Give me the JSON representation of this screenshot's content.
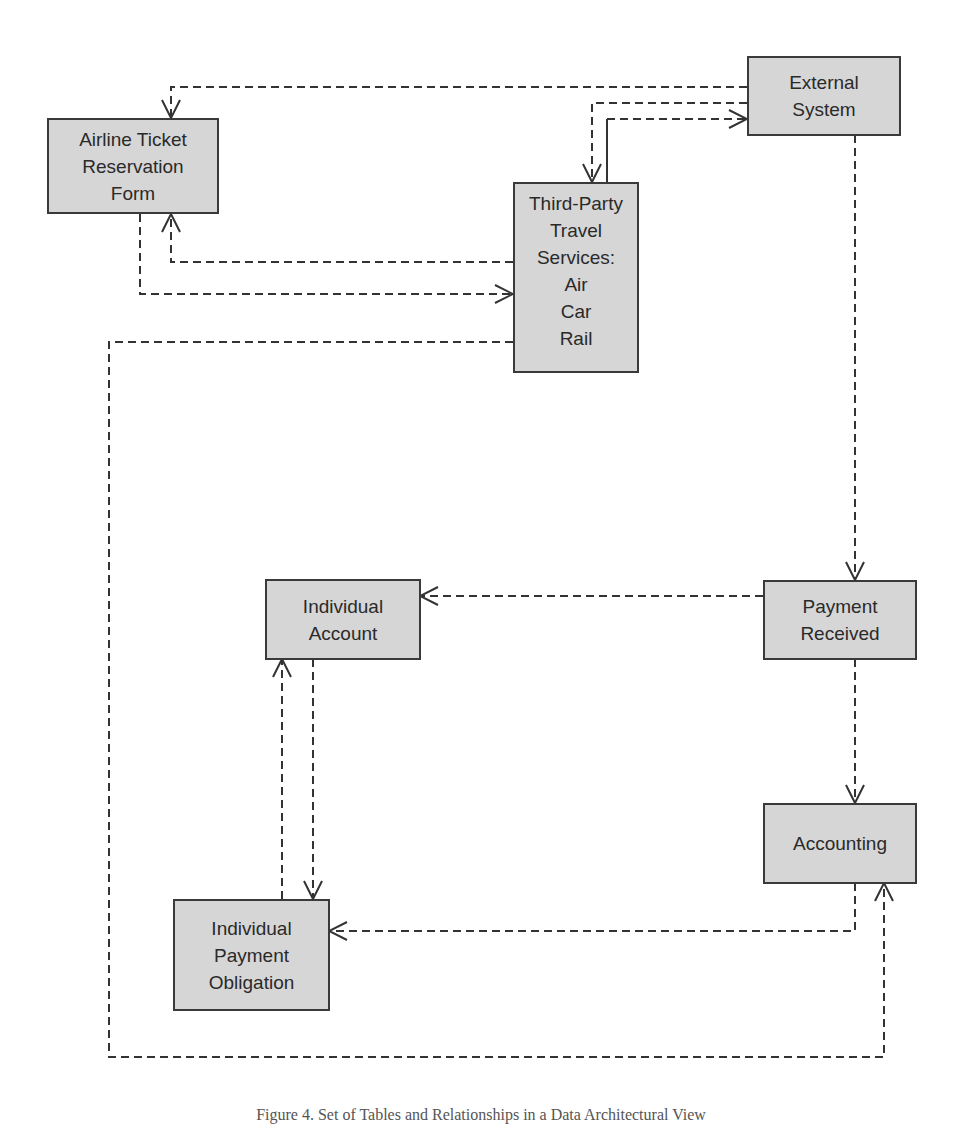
{
  "diagram": {
    "title": "Set of Tables and Relationships in a Data Architectural View",
    "line_color": "#333333",
    "box_fill": "#d6d6d6",
    "box_border": "#3a3a3a",
    "nodes": {
      "airline": {
        "lines": [
          "Airline Ticket",
          "Reservation",
          "Form"
        ]
      },
      "external": {
        "lines": [
          "External",
          "System"
        ]
      },
      "thirdparty": {
        "lines": [
          "Third-Party",
          "Travel",
          "Services:",
          "Air",
          "Car",
          "Rail"
        ]
      },
      "account": {
        "lines": [
          "Individual",
          "Account"
        ]
      },
      "payment": {
        "lines": [
          "Payment",
          "Received"
        ]
      },
      "accounting": {
        "lines": [
          "Accounting"
        ]
      },
      "obligation": {
        "lines": [
          "Individual",
          "Payment",
          "Obligation"
        ]
      }
    },
    "edges": [
      {
        "from": "External System",
        "to": "Airline Ticket Reservation Form",
        "style": "dashed"
      },
      {
        "from": "External System",
        "to": "Third-Party Travel Services",
        "style": "dashed"
      },
      {
        "from": "Third-Party Travel Services",
        "to": "External System",
        "style": "dashed"
      },
      {
        "from": "Third-Party Travel Services",
        "to": "Airline Ticket Reservation Form",
        "style": "dashed"
      },
      {
        "from": "Airline Ticket Reservation Form",
        "to": "Third-Party Travel Services",
        "style": "dashed"
      },
      {
        "from": "Third-Party Travel Services",
        "to": "Accounting",
        "style": "dashed"
      },
      {
        "from": "External System",
        "to": "Payment Received",
        "style": "dashed"
      },
      {
        "from": "Payment Received",
        "to": "Individual Account",
        "style": "dashed"
      },
      {
        "from": "Payment Received",
        "to": "Accounting",
        "style": "dashed"
      },
      {
        "from": "Individual Account",
        "to": "Individual Payment Obligation",
        "style": "dashed"
      },
      {
        "from": "Individual Payment Obligation",
        "to": "Individual Account",
        "style": "dashed"
      },
      {
        "from": "Accounting",
        "to": "Individual Payment Obligation",
        "style": "dashed"
      }
    ]
  },
  "caption": "Figure 4. Set of Tables and Relationships in a Data Architectural View"
}
